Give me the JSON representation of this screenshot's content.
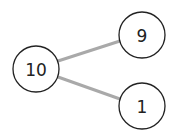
{
  "diagram": {
    "type": "tree",
    "colors": {
      "edge": "#a9a9a9",
      "node_stroke": "#222222",
      "node_fill": "#ffffff"
    },
    "nodes": [
      {
        "id": "n10",
        "label": "10",
        "cx": 36,
        "cy": 69,
        "r": 23
      },
      {
        "id": "n9",
        "label": "9",
        "cx": 142,
        "cy": 35,
        "r": 23
      },
      {
        "id": "n1",
        "label": "1",
        "cx": 142,
        "cy": 106,
        "r": 23
      }
    ],
    "edges": [
      {
        "from": "n10",
        "to": "n9",
        "x1": 58,
        "y1": 61,
        "x2": 120,
        "y2": 41
      },
      {
        "from": "n10",
        "to": "n1",
        "x1": 58,
        "y1": 77,
        "x2": 120,
        "y2": 99
      }
    ]
  }
}
